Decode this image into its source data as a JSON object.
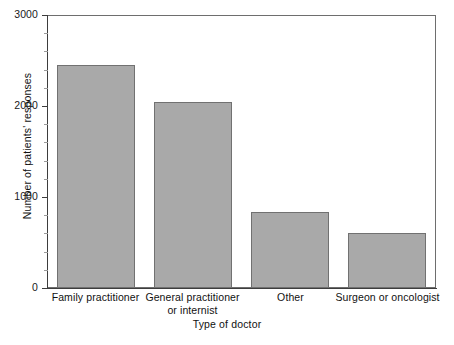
{
  "chart_data": {
    "type": "bar",
    "title": "",
    "xlabel": "Type of doctor",
    "ylabel": "Number of patients' responses",
    "categories": [
      "Family practitioner",
      "General practitioner or internist",
      "Other",
      "Surgeon or oncologist"
    ],
    "category_lines": [
      [
        "Family practitioner"
      ],
      [
        "General practitioner",
        "or internist"
      ],
      [
        "Other"
      ],
      [
        "Surgeon or oncologist"
      ]
    ],
    "values": [
      2450,
      2040,
      840,
      600
    ],
    "ylim": [
      0,
      3000
    ],
    "yticks": [
      0,
      1000,
      2000,
      3000
    ],
    "ytick_labels": [
      "0",
      "1000",
      "2000",
      "3000"
    ],
    "yminor_step": 200,
    "grid": false,
    "legend": null,
    "bar_color": "#a9a9a9",
    "bar_edge_color": "#717171",
    "axis_color": "#3d3d3d",
    "frame_color": "#6e6e6e",
    "background": "#ffffff"
  }
}
